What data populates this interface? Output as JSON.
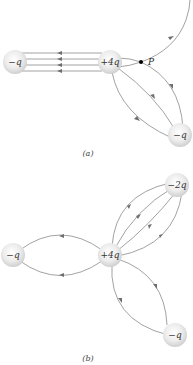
{
  "figure": {
    "panels": [
      {
        "id": "a",
        "label": "(a)",
        "charges": [
          {
            "label": "−q",
            "value": "-q",
            "x": 15,
            "y": 62
          },
          {
            "label": "+4q",
            "value": "+4q",
            "x": 110,
            "y": 62
          },
          {
            "label": "−q",
            "value": "-q",
            "x": 180,
            "y": 135
          }
        ],
        "point": {
          "label": "P",
          "x": 141,
          "y": 62
        },
        "field_lines": {
          "from_plus4q_to_left_minus_q": 4,
          "from_plus4q_to_lower_minus_q": 3,
          "escaping_through_P": 1
        }
      },
      {
        "id": "b",
        "label": "(b)",
        "charges": [
          {
            "label": "−q",
            "value": "-q",
            "x": 13,
            "y": 255
          },
          {
            "label": "+4q",
            "value": "+4q",
            "x": 110,
            "y": 255
          },
          {
            "label": "−2q",
            "value": "-2q",
            "x": 177,
            "y": 185
          },
          {
            "label": "−q",
            "value": "-q",
            "x": 175,
            "y": 335
          }
        ],
        "field_lines": {
          "from_plus4q_to_left_minus_q": 2,
          "from_plus4q_to_minus_2q": 4,
          "from_plus4q_to_lower_minus_q": 2
        }
      }
    ],
    "colors": {
      "line": "#8a8a8a",
      "arrow": "#6e6e6e",
      "sphere_center": "#ffffff",
      "sphere_edge": "#cfcfcf",
      "point": "#000000"
    }
  }
}
